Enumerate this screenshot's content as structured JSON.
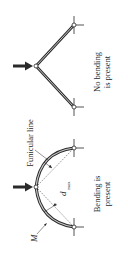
{
  "figure": {
    "orientation": "rotated 90 degrees clockwise",
    "colors": {
      "ink": "#2a2a2a",
      "member_fill": "#bdbdbd",
      "background": "#ffffff"
    },
    "top_diagram": {
      "caption_line1": "No bending",
      "caption_line2": "is present",
      "shape": "straight members (follows funicular line)"
    },
    "bottom_diagram": {
      "caption_line1": "Bending is",
      "caption_line2": "present",
      "shape": "curved arch deviating from funicular line",
      "label_funicular": "Funicular line",
      "label_moment": "M",
      "label_dmax_main": "d",
      "label_dmax_sub": "max"
    }
  }
}
